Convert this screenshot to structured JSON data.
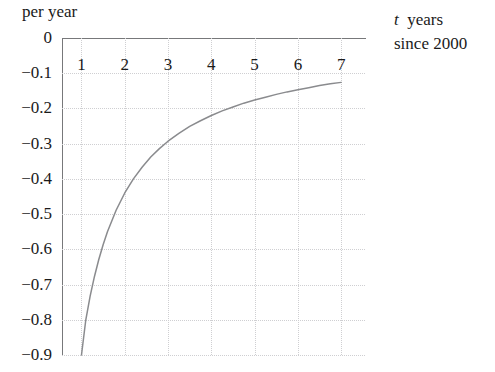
{
  "chart_data": {
    "type": "line",
    "title": "",
    "ylabel": "per year",
    "xlabel": "t years since 2000",
    "xlabel_var": "t",
    "xlabel_rest": "years",
    "xlabel_line2": "since 2000",
    "xlim": [
      0.55,
      7.55
    ],
    "ylim": [
      -0.9,
      0.0
    ],
    "grid": true,
    "legend": false,
    "xticks": [
      1,
      2,
      3,
      4,
      5,
      6,
      7
    ],
    "xtick_labels": [
      "1",
      "2",
      "3",
      "4",
      "5",
      "6",
      "7"
    ],
    "yticks": [
      0,
      -0.1,
      -0.2,
      -0.3,
      -0.4,
      -0.5,
      -0.6,
      -0.7,
      -0.8,
      -0.9
    ],
    "ytick_labels": [
      "0",
      "−0.1",
      "−0.2",
      "−0.3",
      "−0.4",
      "−0.5",
      "−0.6",
      "−0.7",
      "−0.8",
      "−0.9"
    ],
    "curve_color": "#8a8b8e",
    "grid_color": "#cfcfd2",
    "axis_color": "#77787a",
    "series": [
      {
        "name": "rate of change",
        "x": [
          1.0,
          1.1,
          1.2,
          1.3,
          1.4,
          1.5,
          1.6,
          1.8,
          2.0,
          2.2,
          2.4,
          2.6,
          2.8,
          3.0,
          3.25,
          3.5,
          3.75,
          4.0,
          4.25,
          4.5,
          4.75,
          5.0,
          5.25,
          5.5,
          5.75,
          6.0,
          6.25,
          6.5,
          6.75,
          7.0
        ],
        "y": [
          -0.9,
          -0.8,
          -0.733,
          -0.677,
          -0.629,
          -0.587,
          -0.55,
          -0.489,
          -0.44,
          -0.4,
          -0.367,
          -0.338,
          -0.314,
          -0.293,
          -0.271,
          -0.251,
          -0.235,
          -0.22,
          -0.207,
          -0.196,
          -0.185,
          -0.176,
          -0.168,
          -0.16,
          -0.153,
          -0.147,
          -0.141,
          -0.135,
          -0.13,
          -0.126
        ]
      }
    ]
  },
  "axes": {
    "y_title": "per year",
    "x_title_var": "t",
    "x_title_word": "years",
    "x_title_line2": "since 2000"
  }
}
